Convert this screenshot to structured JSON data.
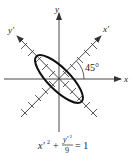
{
  "figure": {
    "top_text_fragment": "",
    "axes": {
      "x_label": "x",
      "y_label": "y",
      "x_prime_label": "x′",
      "y_prime_label": "y′"
    },
    "angle_label": "45°",
    "equation": {
      "term1": "x′",
      "term1_exp": "2",
      "plus": "+",
      "frac_num": "y′",
      "frac_num_exp": "2",
      "frac_den": "9",
      "equals": "= 1"
    },
    "colors": {
      "axis": "#333333",
      "ellipse": "#111111",
      "background": "#ffffff"
    }
  }
}
